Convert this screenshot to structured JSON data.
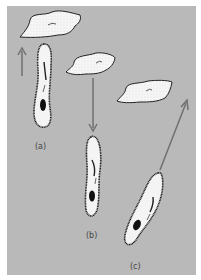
{
  "figure": {
    "background": "#b9b9b9",
    "panels": [
      {
        "id": "a",
        "label": "(a)",
        "direction": "up",
        "description": "organism moving toward food particle above"
      },
      {
        "id": "b",
        "label": "(b)",
        "direction": "down",
        "description": "food particle above, organism below with arrow pointing down"
      },
      {
        "id": "c",
        "label": "(c)",
        "direction": "diagonal-up-right",
        "description": "organism oriented diagonally toward food particle upper right"
      }
    ],
    "colors": {
      "arrow": "#707070",
      "outline": "#1a1a1a",
      "cell_fill": "#f4f4f4",
      "nucleus": "#111111"
    }
  }
}
